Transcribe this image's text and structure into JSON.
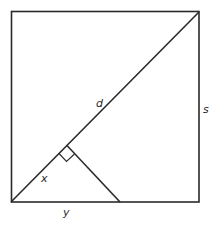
{
  "diagram": {
    "type": "geometry",
    "colors": {
      "stroke": "#2a2a2a",
      "background": "#ffffff"
    },
    "labels": {
      "diagonal": "d",
      "side": "s",
      "diagonal_segment": "x",
      "base_segment": "y"
    },
    "shapes": {
      "square": {
        "x1": 11,
        "y1": 11,
        "x2": 199,
        "y2": 202
      },
      "diagonal": {
        "from": [
          11,
          202
        ],
        "to": [
          199,
          12
        ]
      },
      "perpendicular": {
        "from": [
          67,
          146
        ],
        "to": [
          120,
          202
        ]
      },
      "right_angle_marker": true
    }
  }
}
